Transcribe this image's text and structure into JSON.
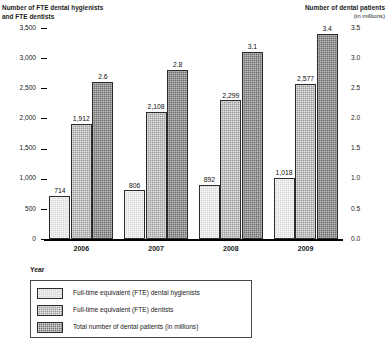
{
  "chart_data": {
    "type": "bar",
    "title": "",
    "categories": [
      "2006",
      "2007",
      "2008",
      "2009"
    ],
    "xlabel": "Year",
    "series": [
      {
        "name": "Full-time equivalent (FTE) dental hygienists",
        "axis": "left",
        "color": "#d5d5d5",
        "values": [
          714,
          806,
          892,
          1018
        ],
        "labels": [
          "714",
          "806",
          "892",
          "1,018"
        ]
      },
      {
        "name": "Full-time equivalent (FTE) dentists",
        "axis": "left",
        "color": "#9c9c9c",
        "values": [
          1912,
          2108,
          2299,
          2577
        ],
        "labels": [
          "1,912",
          "2,108",
          "2,299",
          "2,577"
        ]
      },
      {
        "name": "Total number of dental patients (in millions)",
        "axis": "right",
        "color": "#6e6e6e",
        "values": [
          2.6,
          2.8,
          3.1,
          3.4
        ],
        "labels": [
          "2.6",
          "2.8",
          "3.1",
          "3.4"
        ]
      }
    ],
    "left_axis": {
      "title": "Number of FTE dental hygienists\nand FTE dentists",
      "ylim": [
        0,
        3500
      ],
      "ticks": [
        0,
        500,
        1000,
        1500,
        2000,
        2500,
        3000,
        3500
      ],
      "tick_labels": [
        "0",
        "500",
        "1,000",
        "1,500",
        "2,000",
        "2,500",
        "3,000",
        "3,500"
      ]
    },
    "right_axis": {
      "title": "Number of dental patients",
      "subtitle": "(in millions)",
      "ylim": [
        0,
        3.5
      ],
      "ticks": [
        0,
        0.5,
        1.0,
        1.5,
        2.0,
        2.5,
        3.0,
        3.5
      ],
      "tick_labels": [
        "0.0",
        "0.5",
        "1.0",
        "1.5",
        "2.0",
        "2.5",
        "3.0",
        "3.5"
      ]
    },
    "grid": false,
    "legend_position": "bottom-left"
  },
  "legend": {
    "title": "Year",
    "entries": [
      "Full-time equivalent (FTE) dental hygienists",
      "Full-time equivalent (FTE) dentists",
      "Total number of dental patients (in millions)"
    ]
  }
}
